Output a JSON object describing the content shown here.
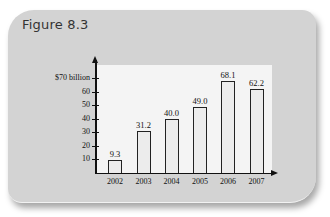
{
  "figure": {
    "title": "Figure 8.3"
  },
  "chart_data": {
    "type": "bar",
    "title": "Figure 8.3",
    "categories": [
      "2002",
      "2003",
      "2004",
      "2005",
      "2006",
      "2007"
    ],
    "values": [
      9.3,
      31.2,
      40.0,
      49.0,
      68.1,
      62.2
    ],
    "value_labels": [
      "9.3",
      "31.2",
      "40.0",
      "49.0",
      "68.1",
      "62.2"
    ],
    "xlabel": "",
    "ylabel": "",
    "yticks": [
      "10",
      "20",
      "30",
      "40",
      "50",
      "60",
      "$70 billion"
    ],
    "ylim": [
      0,
      75
    ],
    "grid": false,
    "legend": null
  }
}
